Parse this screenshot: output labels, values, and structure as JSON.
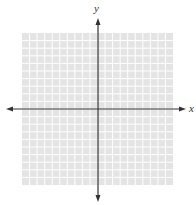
{
  "diagram": {
    "type": "coordinate-plane",
    "x_axis_label": "x",
    "y_axis_label": "y",
    "grid": {
      "columns": 20,
      "rows": 20,
      "left": 22,
      "top": 33,
      "width": 151,
      "height": 152,
      "fill_color": "#e4e4e4",
      "line_color": "#ffffff"
    },
    "origin": {
      "px_x": 98,
      "px_y": 109
    },
    "axis_color": "#333333",
    "x_axis_extent": {
      "from": 6,
      "to": 186
    },
    "y_axis_extent": {
      "from": 18,
      "to": 202
    }
  }
}
